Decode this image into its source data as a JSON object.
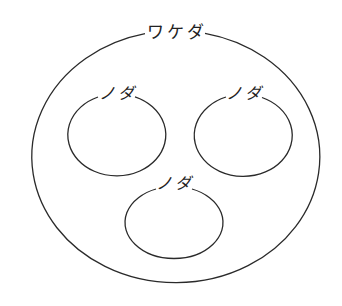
{
  "diagram": {
    "type": "nested-sets",
    "stroke_color": "#2a2a2a",
    "outer": {
      "label": "ワケダ"
    },
    "inner": [
      {
        "label": "ノダ"
      },
      {
        "label": "ノダ"
      },
      {
        "label": "ノダ"
      }
    ]
  }
}
